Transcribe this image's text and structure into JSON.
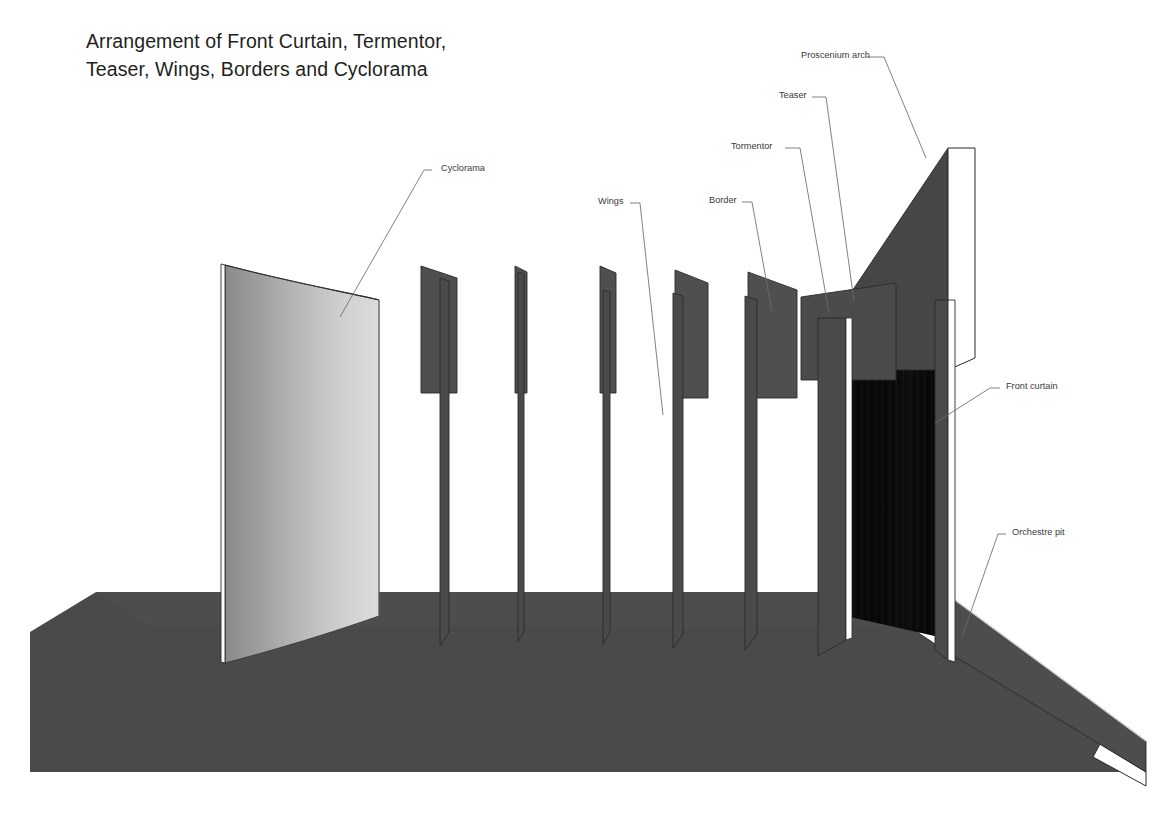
{
  "title": {
    "line1": "Arrangement of Front Curtain, Termentor,",
    "line2": "Teaser, Wings, Borders and Cyclorama"
  },
  "labels": {
    "cyclorama": "Cyclorama",
    "wings": "Wings",
    "border": "Border",
    "tormentor": "Tormentor",
    "teaser": "Teaser",
    "proscenium_arch": "Proscenium arch",
    "front_curtain": "Front curtain",
    "orchestre_pit": "Orchestre pit"
  },
  "colors": {
    "background": "#ffffff",
    "stage_floor": "#4a4a4a",
    "floor_front_face": "#555555",
    "panel_gray": "#4f4f4f",
    "panel_gray_dark": "#454545",
    "proscenium": "#464646",
    "front_curtain": "#0b0b0b",
    "cyclorama_left": "#8d8d8d",
    "cyclorama_right": "#d9d9d9",
    "leader_line": "#6b6b6b",
    "outline": "#2b2b2b",
    "label_text": "#3a3a3a",
    "title_text": "#231f20",
    "edge_white": "#ffffff"
  },
  "scene": {
    "description": "Perspective line drawing of a theatre stage showing the cyclorama at rear, a series of wing panels and borders, the tormentor and teaser, the proscenium arch, the front curtain and the orchestre pit.",
    "elements": [
      {
        "name": "cyclorama",
        "role": "curved rear backdrop"
      },
      {
        "name": "wing-unit-1",
        "role": "border panel with wing"
      },
      {
        "name": "wing-unit-2",
        "role": "wing edge-on"
      },
      {
        "name": "wing-unit-3",
        "role": "wing edge-on"
      },
      {
        "name": "wing-unit-4",
        "role": "border panel with wing"
      },
      {
        "name": "wing-unit-5",
        "role": "border panel with wing"
      },
      {
        "name": "tormentor",
        "role": "downstage masking panel"
      },
      {
        "name": "teaser",
        "role": "overhead masking border"
      },
      {
        "name": "proscenium-arch",
        "role": "stage opening frame"
      },
      {
        "name": "front-curtain",
        "role": "main drape"
      },
      {
        "name": "orchestre-pit",
        "role": "recess in front of stage"
      },
      {
        "name": "stage-floor",
        "role": "stage deck"
      }
    ]
  }
}
